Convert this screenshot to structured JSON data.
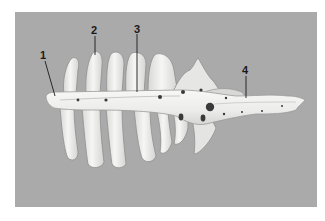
{
  "figure": {
    "background_color": "#aaaaaa",
    "bone_color": "#f2f2f0",
    "labels": [
      {
        "id": "1",
        "text": "1",
        "x": 43,
        "y": 50
      },
      {
        "id": "2",
        "text": "2",
        "x": 94,
        "y": 25
      },
      {
        "id": "3",
        "text": "3",
        "x": 137,
        "y": 24
      },
      {
        "id": "4",
        "text": "4",
        "x": 245,
        "y": 65
      }
    ]
  }
}
